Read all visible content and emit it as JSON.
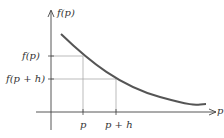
{
  "diagram": {
    "y_axis_label": "f(p)",
    "x_axis_label": "p",
    "tick_labels_y": [
      "f(p)",
      "f(p + h)"
    ],
    "tick_labels_x": [
      "p",
      "p + h"
    ],
    "curve": "decreasing convex curve",
    "colors": {
      "curve": "#555555",
      "axes": "#444444",
      "guides": "#aaaaaa"
    }
  }
}
